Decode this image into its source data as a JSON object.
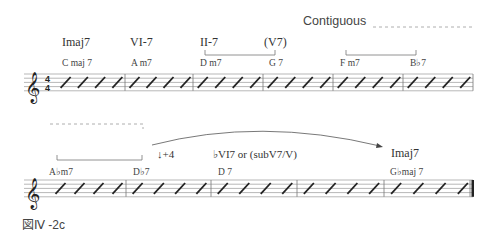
{
  "figure_label": "図Ⅳ -2c",
  "contiguous_label": "Contiguous",
  "time_signature": {
    "top": "4",
    "bottom": "4"
  },
  "clef": "𝄞",
  "staff1": {
    "roman": [
      "Imaj7",
      "VI-7",
      "II-7",
      "(V7)"
    ],
    "chords": [
      "C maj 7",
      "A m7",
      "D m7",
      "G 7",
      "F m7",
      "B♭7"
    ]
  },
  "staff2": {
    "interval": "↓+4",
    "roman": [
      "♭VI7 or (subV7/V)",
      "Imaj7"
    ],
    "chords": [
      "A♭m7",
      "D♭7",
      "D 7",
      "G♭maj 7"
    ]
  },
  "slashes_per_measure": 4
}
